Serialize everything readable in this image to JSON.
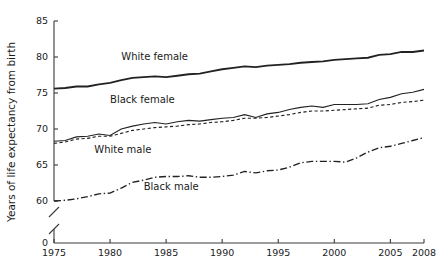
{
  "chart_data": {
    "type": "line",
    "title": "",
    "xlabel": "",
    "ylabel": "Years of life expectancy from birth",
    "xlim": [
      1975,
      2008
    ],
    "ylim": [
      58.5,
      85
    ],
    "grid": false,
    "legend": "inline-labels",
    "axis_break": true,
    "axis_break_note": "y-axis broken between 0 and 60",
    "xticks": [
      1975,
      1980,
      1985,
      1990,
      1995,
      2000,
      2005,
      2008
    ],
    "xtick_labels": [
      "1975",
      "1980",
      "1985",
      "1990",
      "1995",
      "2000",
      "2005",
      "2008"
    ],
    "yticks": [
      0,
      60,
      65,
      70,
      75,
      80,
      85
    ],
    "ytick_labels": [
      "0",
      "60",
      "65",
      "70",
      "75",
      "80",
      "85"
    ],
    "x": [
      1975,
      1976,
      1977,
      1978,
      1979,
      1980,
      1981,
      1982,
      1983,
      1984,
      1985,
      1986,
      1987,
      1988,
      1989,
      1990,
      1991,
      1992,
      1993,
      1994,
      1995,
      1996,
      1997,
      1998,
      1999,
      2000,
      2001,
      2002,
      2003,
      2004,
      2005,
      2006,
      2007,
      2008
    ],
    "series": [
      {
        "name": "White female",
        "label": "White female",
        "style": "solid-thick",
        "label_x": 1981.0,
        "label_y": 79.6,
        "values": [
          75.6,
          75.7,
          75.9,
          75.9,
          76.2,
          76.4,
          76.8,
          77.1,
          77.2,
          77.3,
          77.2,
          77.4,
          77.6,
          77.7,
          78.0,
          78.3,
          78.5,
          78.7,
          78.6,
          78.8,
          78.9,
          79.0,
          79.2,
          79.3,
          79.4,
          79.6,
          79.7,
          79.8,
          79.9,
          80.3,
          80.4,
          80.7,
          80.7,
          80.9
        ]
      },
      {
        "name": "Black female",
        "label": "Black female",
        "style": "solid-thin",
        "label_x": 1980.0,
        "label_y": 73.6,
        "values": [
          68.3,
          68.4,
          68.9,
          69.0,
          69.3,
          69.1,
          70.0,
          70.4,
          70.7,
          70.9,
          70.7,
          71.0,
          71.2,
          71.1,
          71.3,
          71.5,
          71.6,
          72.0,
          71.6,
          72.1,
          72.3,
          72.7,
          73.0,
          73.2,
          73.0,
          73.4,
          73.4,
          73.4,
          73.5,
          74.1,
          74.4,
          74.9,
          75.1,
          75.5
        ]
      },
      {
        "name": "White male",
        "label": "White male",
        "style": "dashed",
        "label_x": 1978.6,
        "label_y": 66.7,
        "values": [
          68.0,
          68.2,
          68.6,
          68.7,
          69.0,
          69.0,
          69.4,
          69.8,
          70.0,
          70.2,
          70.3,
          70.4,
          70.6,
          70.7,
          70.9,
          71.0,
          71.2,
          71.5,
          71.5,
          71.6,
          71.8,
          72.0,
          72.3,
          72.5,
          72.5,
          72.6,
          72.7,
          72.8,
          72.9,
          73.3,
          73.4,
          73.7,
          73.8,
          74.0
        ]
      },
      {
        "name": "Black male",
        "label": "Black male",
        "style": "dash-dot",
        "label_x": 1983.0,
        "label_y": 61.5,
        "values": [
          60.0,
          60.1,
          60.3,
          60.6,
          61.0,
          61.1,
          61.8,
          62.6,
          62.9,
          63.3,
          63.4,
          63.4,
          63.5,
          63.3,
          63.3,
          63.4,
          63.6,
          64.1,
          63.9,
          64.2,
          64.3,
          64.7,
          65.3,
          65.5,
          65.5,
          65.5,
          65.4,
          66.0,
          66.8,
          67.4,
          67.6,
          68.0,
          68.4,
          68.8
        ]
      }
    ]
  }
}
